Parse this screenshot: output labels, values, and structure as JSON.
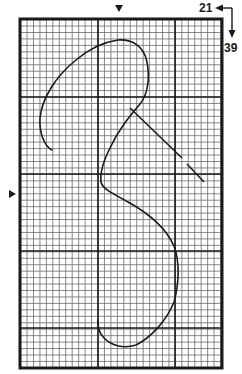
{
  "diagram": {
    "type": "chart-grid-stitch-pattern",
    "labels": {
      "columns": "21",
      "rows": "39"
    },
    "colors": {
      "ink": "#1a1a1a",
      "grid_minor": "#6a6a6a",
      "grid_major": "#1a1a1a",
      "background": "#ffffff"
    },
    "grid": {
      "left": 20,
      "top": 19,
      "right": 222,
      "bottom": 368,
      "cell": 6.45,
      "major_x": [
        98,
        175
      ],
      "major_y": [
        97,
        174,
        251,
        328
      ]
    },
    "markers": {
      "top_center_x": 119,
      "left_center_y": 194
    },
    "curve_points": "M52,150 C44,146 39,132 40,118 C42,98 56,76 76,60 C90,48 104,42 118,40 C132,39 144,46 147,62 C150,78 148,94 140,104 C130,116 118,130 110,148 C103,162 100,174 101,182 C102,188 110,192 128,202 C148,213 166,228 174,246 C180,262 179,284 174,302 C166,322 150,338 136,345 C124,349 112,346 104,338 C98,332 98,326 98,320",
    "guide_line_segments": [
      {
        "x1": 130,
        "y1": 108,
        "x2": 182,
        "y2": 158
      },
      {
        "x1": 187,
        "y1": 164,
        "x2": 204,
        "y2": 182
      }
    ]
  }
}
